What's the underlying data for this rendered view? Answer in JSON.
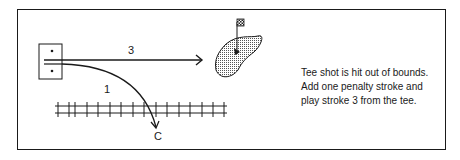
{
  "diagram": {
    "stroke_labels": {
      "first": "1",
      "third": "3"
    },
    "ball_marker": "C",
    "caption": {
      "lines": [
        "Tee shot is hit out of bounds.",
        "Add one penalty stroke and",
        "play stroke 3 from the tee."
      ]
    },
    "elements": {
      "tee_box": "tee-box",
      "green": "putting-green",
      "flag": "pin-flag",
      "fence": "out-of-bounds-fence"
    },
    "colors": {
      "ink": "#1a1a1a",
      "green_fill": "#bdbdbd",
      "background": "#ffffff"
    }
  }
}
